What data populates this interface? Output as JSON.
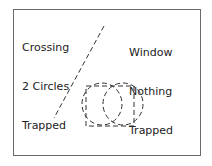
{
  "labels": {
    "crossing": [
      "Crossing",
      "2 Circles",
      "Trapped"
    ],
    "window": [
      "Window",
      "Nothing",
      "Trapped"
    ]
  },
  "colors": {
    "stroke": "#333333",
    "frame": "#6a6a6a",
    "background": "#ffffff"
  },
  "shapes": {
    "diagonal_line": "dashed selection line",
    "circles": 2,
    "rectangle": "dashed window"
  }
}
